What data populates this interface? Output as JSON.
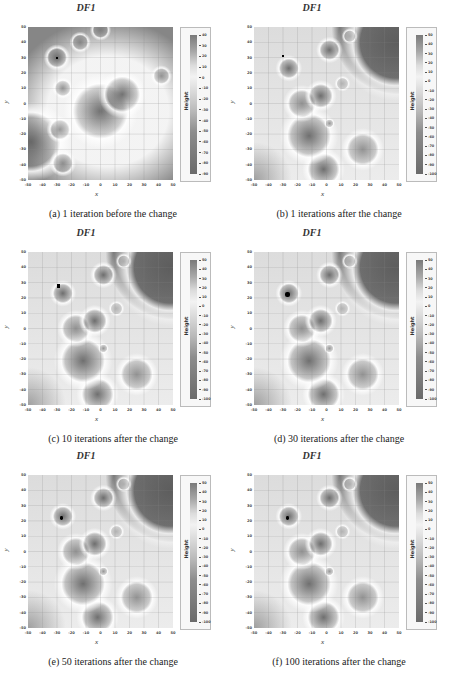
{
  "figure": {
    "panels": [
      {
        "id": "a",
        "title": "DF1",
        "caption": "(a)  1 iteration before the change",
        "colorbar_ticks": [
          "40",
          "30",
          "20",
          "10",
          "0",
          "-10",
          "-20",
          "-30",
          "-40",
          "-50",
          "-60",
          "-70",
          "-80",
          "-90"
        ]
      },
      {
        "id": "b",
        "title": "DF1",
        "caption": "(b)  1 iterations after the change",
        "colorbar_ticks": [
          "50",
          "40",
          "30",
          "20",
          "10",
          "0",
          "-10",
          "-20",
          "-30",
          "-40",
          "-50",
          "-60",
          "-70",
          "-80",
          "-90",
          "-100"
        ]
      },
      {
        "id": "c",
        "title": "DF1",
        "caption": "(c)  10 iterations after the change",
        "colorbar_ticks": [
          "50",
          "40",
          "30",
          "20",
          "10",
          "0",
          "-10",
          "-20",
          "-30",
          "-40",
          "-50",
          "-60",
          "-70",
          "-80",
          "-90",
          "-100"
        ]
      },
      {
        "id": "d",
        "title": "DF1",
        "caption": "(d)  30 iterations after the change",
        "colorbar_ticks": [
          "50",
          "40",
          "30",
          "20",
          "10",
          "0",
          "-10",
          "-20",
          "-30",
          "-40",
          "-50",
          "-60",
          "-70",
          "-80",
          "-90",
          "-100"
        ]
      },
      {
        "id": "e",
        "title": "DF1",
        "caption": "(e)  50 iterations after the change",
        "colorbar_ticks": [
          "50",
          "40",
          "30",
          "20",
          "10",
          "0",
          "-10",
          "-20",
          "-30",
          "-40",
          "-50",
          "-60",
          "-70",
          "-80",
          "-90",
          "-100"
        ]
      },
      {
        "id": "f",
        "title": "DF1",
        "caption": "(f)  100 iterations after the change",
        "colorbar_ticks": [
          "50",
          "40",
          "30",
          "20",
          "10",
          "0",
          "-10",
          "-20",
          "-30",
          "-40",
          "-50",
          "-60",
          "-70",
          "-80",
          "-90",
          "-100"
        ]
      }
    ],
    "x_ticks": [
      "-50",
      "-40",
      "-30",
      "-20",
      "-10",
      "0",
      "10",
      "20",
      "30",
      "40",
      "50"
    ],
    "y_ticks": [
      "50",
      "40",
      "30",
      "20",
      "10",
      "0",
      "-10",
      "-20",
      "-30",
      "-40",
      "-50"
    ],
    "xlabel": "x",
    "ylabel": "y",
    "colorbar_label": "Height",
    "colors": {
      "background": "#e6e6e6",
      "dark": "#6e6e6e",
      "light": "#f4f4f4",
      "marker": "#000000"
    }
  },
  "chart_data": [
    {
      "type": "heatmap",
      "title": "DF1",
      "subtitle": "(a) 1 iteration before the change",
      "xlabel": "x",
      "ylabel": "y",
      "xlim": [
        -50,
        50
      ],
      "ylim": [
        -50,
        50
      ],
      "grid": true,
      "colorbar": {
        "label": "Height",
        "range": [
          -90,
          40
        ]
      },
      "blobs": [
        {
          "x": -30,
          "y": 30,
          "r": 5,
          "depth": "dark"
        },
        {
          "x": -14,
          "y": 40,
          "r": 4,
          "depth": "mid"
        },
        {
          "x": 0,
          "y": 48,
          "r": 4,
          "depth": "mid"
        },
        {
          "x": -26,
          "y": 10,
          "r": 4,
          "depth": "mid"
        },
        {
          "x": 42,
          "y": 18,
          "r": 4,
          "depth": "mid"
        },
        {
          "x": 15,
          "y": 6,
          "r": 9,
          "depth": "dark"
        },
        {
          "x": 0,
          "y": -5,
          "r": 14,
          "depth": "dark"
        },
        {
          "x": -28,
          "y": -17,
          "r": 5,
          "depth": "mid"
        },
        {
          "x": -26,
          "y": -39,
          "r": 5,
          "depth": "mid"
        },
        {
          "x": -48,
          "y": -25,
          "r": 15,
          "depth": "dark"
        }
      ],
      "population_marker": {
        "x": -30,
        "y": 30
      }
    },
    {
      "type": "heatmap",
      "title": "DF1",
      "subtitle": "(b) 1 iterations after the change",
      "xlabel": "x",
      "ylabel": "y",
      "xlim": [
        -50,
        50
      ],
      "ylim": [
        -50,
        50
      ],
      "grid": true,
      "colorbar": {
        "label": "Height",
        "range": [
          -100,
          50
        ]
      },
      "blobs": [
        {
          "x": 2,
          "y": 35,
          "r": 5,
          "depth": "dark"
        },
        {
          "x": 16,
          "y": 44,
          "r": 3,
          "depth": "light"
        },
        {
          "x": -26,
          "y": 23,
          "r": 5,
          "depth": "dark"
        },
        {
          "x": 11,
          "y": 13,
          "r": 3,
          "depth": "light"
        },
        {
          "x": -4,
          "y": 5,
          "r": 6,
          "depth": "dark"
        },
        {
          "x": -17,
          "y": 0,
          "r": 7,
          "depth": "mid"
        },
        {
          "x": 2,
          "y": -13,
          "r": 2,
          "depth": "mid"
        },
        {
          "x": -12,
          "y": -21,
          "r": 11,
          "depth": "dark"
        },
        {
          "x": 25,
          "y": -30,
          "r": 8,
          "depth": "mid"
        },
        {
          "x": -2,
          "y": -43,
          "r": 8,
          "depth": "dark"
        },
        {
          "x": 48,
          "y": 40,
          "r": 22,
          "depth": "dark"
        }
      ],
      "population_marker": {
        "x": -30,
        "y": 31
      }
    },
    {
      "type": "heatmap",
      "title": "DF1",
      "subtitle": "(c) 10 iterations after the change",
      "xlabel": "x",
      "ylabel": "y",
      "xlim": [
        -50,
        50
      ],
      "ylim": [
        -50,
        50
      ],
      "colorbar": {
        "label": "Height",
        "range": [
          -100,
          50
        ]
      },
      "population_marker": {
        "x": -29,
        "y": 28
      }
    },
    {
      "type": "heatmap",
      "title": "DF1",
      "subtitle": "(d) 30 iterations after the change",
      "xlabel": "x",
      "ylabel": "y",
      "xlim": [
        -50,
        50
      ],
      "ylim": [
        -50,
        50
      ],
      "colorbar": {
        "label": "Height",
        "range": [
          -100,
          50
        ]
      },
      "population_marker": {
        "x": -27,
        "y": 22
      }
    },
    {
      "type": "heatmap",
      "title": "DF1",
      "subtitle": "(e) 50 iterations after the change",
      "xlabel": "x",
      "ylabel": "y",
      "xlim": [
        -50,
        50
      ],
      "ylim": [
        -50,
        50
      ],
      "colorbar": {
        "label": "Height",
        "range": [
          -100,
          50
        ]
      },
      "population_marker": {
        "x": -27,
        "y": 22
      }
    },
    {
      "type": "heatmap",
      "title": "DF1",
      "subtitle": "(f) 100 iterations after the change",
      "xlabel": "x",
      "ylabel": "y",
      "xlim": [
        -50,
        50
      ],
      "ylim": [
        -50,
        50
      ],
      "colorbar": {
        "label": "Height",
        "range": [
          -100,
          50
        ]
      },
      "population_marker": {
        "x": -27,
        "y": 22
      }
    }
  ]
}
